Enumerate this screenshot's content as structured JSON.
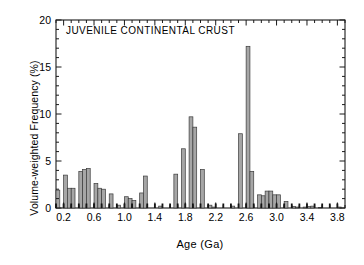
{
  "figure": {
    "title": "JUVENILE CONTINENTAL CRUST",
    "xlabel": "Age  (Ga)",
    "ylabel": "Volume-weighted Frequency (%)",
    "bar_fill_color": "#a6a6a6",
    "bar_edge_color": "#3a3a3a",
    "axis_color": "#1a1a1a",
    "background_color": "#ffffff"
  },
  "axes": {
    "y_ticks": [
      "0",
      "5",
      "10",
      "15",
      "20"
    ],
    "x_ticks": [
      "0.2",
      "0.6",
      "1.0",
      "1.4",
      "1.8",
      "2.2",
      "2.6",
      "3.0",
      "3.4",
      "3.8"
    ]
  },
  "chart_data": {
    "type": "bar",
    "title": "JUVENILE CONTINENTAL CRUST",
    "xlabel": "Age  (Ga)",
    "ylabel": "Volume-weighted Frequency (%)",
    "xlim": [
      0.1,
      3.9
    ],
    "ylim": [
      0,
      20
    ],
    "grid": false,
    "legend": "none",
    "bin_width": 0.05,
    "x_tick_values": [
      0.2,
      0.6,
      1.0,
      1.4,
      1.8,
      2.2,
      2.6,
      3.0,
      3.4,
      3.8
    ],
    "x_tick_labels": [
      "0.2",
      "0.6",
      "1.0",
      "1.4",
      "1.8",
      "2.2",
      "2.6",
      "3.0",
      "3.4",
      "3.8"
    ],
    "y_tick_values": [
      0,
      5,
      10,
      15,
      20
    ],
    "y_tick_labels": [
      "0",
      "5",
      "10",
      "15",
      "20"
    ],
    "x": [
      0.125,
      0.175,
      0.225,
      0.275,
      0.325,
      0.375,
      0.425,
      0.475,
      0.525,
      0.575,
      0.625,
      0.675,
      0.725,
      0.775,
      0.825,
      0.875,
      0.925,
      0.975,
      1.025,
      1.075,
      1.125,
      1.175,
      1.225,
      1.275,
      1.325,
      1.375,
      1.425,
      1.475,
      1.525,
      1.575,
      1.625,
      1.675,
      1.725,
      1.775,
      1.825,
      1.875,
      1.925,
      1.975,
      2.025,
      2.075,
      2.125,
      2.175,
      2.225,
      2.275,
      2.325,
      2.375,
      2.425,
      2.475,
      2.525,
      2.575,
      2.625,
      2.675,
      2.725,
      2.775,
      2.825,
      2.875,
      2.925,
      2.975,
      3.025,
      3.075,
      3.125,
      3.175,
      3.225,
      3.275,
      3.325,
      3.375,
      3.425,
      3.475,
      3.525,
      3.575,
      3.625,
      3.675,
      3.725,
      3.775,
      3.825,
      3.875
    ],
    "values": [
      1.9,
      0.0,
      3.5,
      2.1,
      2.1,
      0.0,
      3.9,
      4.1,
      4.2,
      0.0,
      2.6,
      2.1,
      2.0,
      0.0,
      1.5,
      0.0,
      0.3,
      0.0,
      1.2,
      1.0,
      0.8,
      0.0,
      1.6,
      3.4,
      0.0,
      0.0,
      0.0,
      0.2,
      0.0,
      0.0,
      0.0,
      3.6,
      0.0,
      6.3,
      0.0,
      9.7,
      8.6,
      0.0,
      4.1,
      0.0,
      0.3,
      0.1,
      0.0,
      0.0,
      0.0,
      0.0,
      0.2,
      0.0,
      7.9,
      0.0,
      17.2,
      3.9,
      0.0,
      1.4,
      1.3,
      1.8,
      1.8,
      1.4,
      1.4,
      0.0,
      0.7,
      0.0,
      0.15,
      0.1,
      0.0,
      0.1,
      0.15,
      0.2,
      0.0,
      0.05,
      0.0,
      0.0,
      0.0,
      0.0,
      0.1,
      0.0
    ]
  }
}
